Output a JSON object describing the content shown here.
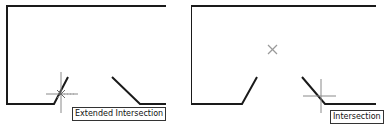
{
  "panels": [
    {
      "name": "extended-intersection-example",
      "tooltip": "Extended Intersection",
      "marker": "crosshair-cursor"
    },
    {
      "name": "intersection-example",
      "tooltip": "Intersection",
      "marker": "crosshair-cursor",
      "aperture_marker": "x-marker"
    }
  ],
  "colors": {
    "line": "#1a1a1a",
    "crosshair": "#8a8a8a",
    "marker": "#9a9a9a",
    "tooltip_border": "#333333",
    "background": "#ffffff"
  }
}
